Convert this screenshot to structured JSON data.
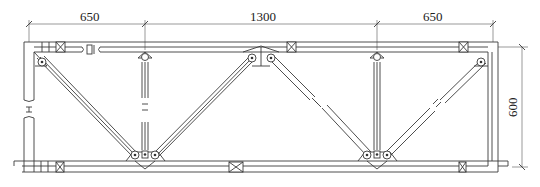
{
  "drawing": {
    "type": "truss-elevation",
    "colors": {
      "line": "#3a3a3a",
      "background": "#ffffff",
      "text": "#222222"
    },
    "dimensions": {
      "horizontal": [
        {
          "label": "650",
          "from_x": 29,
          "to_x": 145
        },
        {
          "label": "1300",
          "from_x": 145,
          "to_x": 377
        },
        {
          "label": "650",
          "from_x": 377,
          "to_x": 493
        }
      ],
      "vertical": [
        {
          "label": "600",
          "from_y": 47,
          "to_y": 167,
          "x": 522
        }
      ]
    },
    "members": {
      "top_chord": "top-chord",
      "bottom_chord": "bottom-chord",
      "left_post": "left-post",
      "right_post": "right-post",
      "verticals": [
        "vertical-left",
        "vertical-right"
      ],
      "diagonals": [
        "diagonal-1",
        "diagonal-2",
        "diagonal-3",
        "diagonal-4",
        "diagonal-5"
      ]
    }
  }
}
